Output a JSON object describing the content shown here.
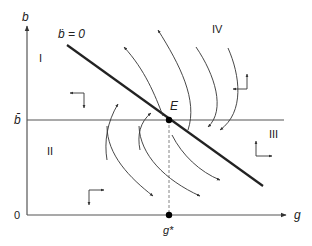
{
  "diagram": {
    "type": "phase-diagram",
    "axes": {
      "x_label": "g",
      "y_label": "b",
      "origin_label": "0"
    },
    "lines": {
      "bdot_zero_label": "ḃ = 0",
      "bbar_label": "b̄"
    },
    "equilibrium": {
      "point_label": "E",
      "g_star_label": "g*"
    },
    "regions": [
      {
        "id": "I",
        "label": "I"
      },
      {
        "id": "II",
        "label": "II"
      },
      {
        "id": "III",
        "label": "III"
      },
      {
        "id": "IV",
        "label": "IV"
      }
    ],
    "colors": {
      "axis": "#555555",
      "line": "#222222",
      "trajectory": "#333333",
      "point": "#000000"
    }
  }
}
